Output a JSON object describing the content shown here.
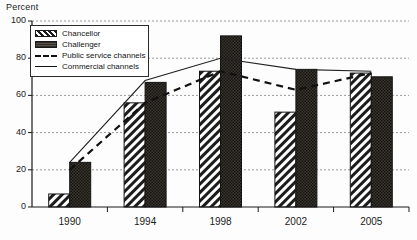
{
  "chart_data": {
    "type": "bar",
    "title": "",
    "ylabel": "Percent",
    "xlabel": "",
    "ylim": [
      0,
      100
    ],
    "yticks": [
      0,
      20,
      40,
      60,
      80,
      100
    ],
    "grid": true,
    "legend_position": "top-left",
    "categories": [
      "1990",
      "1994",
      "1998",
      "2002",
      "2005"
    ],
    "series": [
      {
        "name": "Chancellor",
        "type": "bar",
        "style": "diagonal-hatch",
        "values": [
          7,
          56,
          73,
          51,
          72
        ]
      },
      {
        "name": "Challenger",
        "type": "bar",
        "style": "dark-dotted-fill",
        "values": [
          24,
          67,
          92,
          74,
          70
        ]
      },
      {
        "name": "Public service channels",
        "type": "line",
        "style": "dashed",
        "values": [
          20,
          56,
          73,
          63,
          72
        ]
      },
      {
        "name": "Commercial channels",
        "type": "line",
        "style": "solid",
        "values": [
          24,
          68,
          80,
          74,
          73
        ]
      }
    ]
  },
  "legend": {
    "items": [
      {
        "label": "Chancellor"
      },
      {
        "label": "Challenger"
      },
      {
        "label": "Public service channels"
      },
      {
        "label": "Commercial channels"
      }
    ]
  },
  "colors": {
    "axis": "#1a1a1a",
    "grid": "#9a9a9a",
    "chancellor_fill": "#ffffff",
    "chancellor_hatch": "#1a1a1a",
    "challenger_fill": "#33302b",
    "line_public": "#111111",
    "line_commercial": "#222222",
    "background": "#fdfdfd"
  }
}
